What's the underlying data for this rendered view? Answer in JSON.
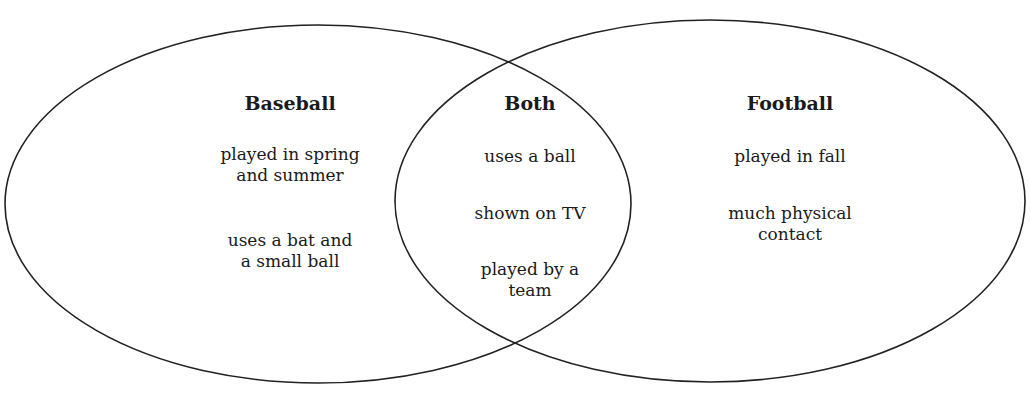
{
  "diagram": {
    "type": "venn",
    "sets": [
      {
        "title": "Baseball",
        "items": [
          "played in spring and summer",
          "uses a bat and a small ball"
        ],
        "lines": [
          [
            "played in spring",
            "and summer"
          ],
          [
            "uses a bat and",
            "a small ball"
          ]
        ]
      },
      {
        "title": "Both",
        "items": [
          "uses a ball",
          "shown on TV",
          "played by a team"
        ],
        "lines": [
          [
            "uses a ball"
          ],
          [
            "shown on TV"
          ],
          [
            "played by a",
            "team"
          ]
        ]
      },
      {
        "title": "Football",
        "items": [
          "played in fall",
          "much physical contact"
        ],
        "lines": [
          [
            "played in fall"
          ],
          [
            "much physical",
            "contact"
          ]
        ]
      }
    ],
    "stroke_color": "#222222"
  }
}
